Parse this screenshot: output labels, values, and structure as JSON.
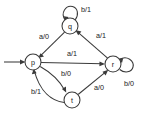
{
  "diagram": {
    "type": "finite-state-machine",
    "nodes": [
      {
        "id": "p",
        "label": "p",
        "cx": 33,
        "cy": 62,
        "r": 8.0
      },
      {
        "id": "q",
        "label": "q",
        "cx": 70,
        "cy": 26,
        "r": 8.0
      },
      {
        "id": "r",
        "label": "r",
        "cx": 113,
        "cy": 64,
        "r": 8.0
      },
      {
        "id": "t",
        "label": "t",
        "cx": 72,
        "cy": 100,
        "r": 8.0
      }
    ],
    "start": {
      "from": "start-marker",
      "to": "p",
      "label": ""
    },
    "edges": [
      {
        "id": "q-to-p",
        "from": "q",
        "to": "p",
        "label": "a/0",
        "label_x": 44,
        "label_y": 36
      },
      {
        "id": "r-to-q",
        "from": "r",
        "to": "q",
        "label": "a/1",
        "label_x": 101,
        "label_y": 35
      },
      {
        "id": "p-to-r",
        "from": "p",
        "to": "r",
        "label": "a/1",
        "label_x": 72,
        "label_y": 53
      },
      {
        "id": "p-to-t",
        "from": "p",
        "to": "t",
        "label": "b/0",
        "label_x": 66,
        "label_y": 73
      },
      {
        "id": "t-to-p",
        "from": "t",
        "to": "p",
        "label": "b/1",
        "label_x": 36,
        "label_y": 91
      },
      {
        "id": "t-to-r",
        "from": "t",
        "to": "r",
        "label": "a/0",
        "label_x": 99,
        "label_y": 87
      },
      {
        "id": "q-self-loop",
        "from": "q",
        "to": "q",
        "label": "b/1",
        "label_x": 86,
        "label_y": 9
      },
      {
        "id": "r-self-loop",
        "from": "r",
        "to": "r",
        "label": "b/0",
        "label_x": 129,
        "label_y": 83
      }
    ],
    "colors": {
      "stroke": "#3a3a3a",
      "text": "#1a1a1a",
      "node_fill": "#ffffff",
      "background": "#ffffff"
    }
  }
}
